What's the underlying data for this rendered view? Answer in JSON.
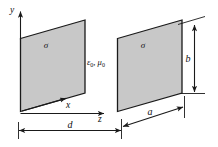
{
  "figure": {
    "type": "physics-diagram",
    "background_color": "#ffffff",
    "plate_fill_color": "#c8c8c8",
    "line_color": "#1a1a1a"
  },
  "plates": [
    {
      "id": "left-plate",
      "charge_label": "σ"
    },
    {
      "id": "right-plate",
      "charge_label": "σ"
    }
  ],
  "axes": {
    "y_label": "y",
    "x_label": "x",
    "z_label": "z"
  },
  "medium": {
    "permittivity": "ε",
    "permittivity_sub": "0",
    "separator": ", ",
    "permeability": "μ",
    "permeability_sub": "0"
  },
  "dimensions": [
    {
      "id": "separation",
      "label": "d",
      "orientation": "horizontal"
    },
    {
      "id": "width",
      "label": "a",
      "orientation": "oblique"
    },
    {
      "id": "height",
      "label": "b",
      "orientation": "vertical"
    }
  ]
}
